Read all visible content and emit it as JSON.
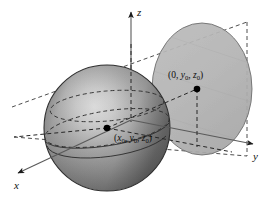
{
  "figure": {
    "type": "3d-geometry-diagram",
    "background_color": "#ffffff"
  },
  "axes": {
    "x": {
      "label": "x",
      "direction": "lower-left",
      "tip": [
        14,
        176
      ],
      "origin": [
        131,
        120
      ]
    },
    "y": {
      "label": "y",
      "direction": "right",
      "tip": [
        257,
        144
      ],
      "origin": [
        131,
        120
      ]
    },
    "z": {
      "label": "z",
      "direction": "up",
      "tip": [
        131,
        8
      ],
      "origin": [
        131,
        120
      ]
    }
  },
  "sphere": {
    "name": "sphere",
    "center_px": [
      107,
      128
    ],
    "radius_px": 63,
    "fill_light": "#d9d9d9",
    "fill_mid": "#8e8e8e",
    "fill_dark": "#4e4e4e",
    "outline_color": "#2b2b2b"
  },
  "plane": {
    "name": "yz-plane-disk",
    "center_px": [
      202,
      89
    ],
    "rx_px": 50,
    "ry_px": 66,
    "fill": "#b6b6b6",
    "outline_color": "#6a6a6a",
    "opacity": 0.92
  },
  "points": [
    {
      "id": "sphere-center",
      "label_prefix": "(",
      "label_parts": [
        "x",
        "0",
        ", y",
        "0",
        ", z",
        "0"
      ],
      "label_text": "(x0, y0, z0)",
      "px": [
        107,
        128
      ],
      "label_px": [
        116,
        140
      ],
      "dot_color": "#000000",
      "dot_radius": 3.3
    },
    {
      "id": "tangency-point",
      "label_prefix": "(",
      "label_parts": [
        "0",
        ", y",
        "0",
        ", z",
        "0"
      ],
      "label_text": "(0, y0, z0)",
      "px": [
        197,
        89
      ],
      "label_px": [
        170,
        78
      ],
      "dot_color": "#000000",
      "dot_radius": 3.3
    }
  ],
  "labels": {
    "x_axis": "x",
    "y_axis": "y",
    "z_axis": "z",
    "center_open": "(",
    "center_x": "x",
    "center_sub0_a": "0",
    "center_comma1": ", ",
    "center_y": "y",
    "center_sub0_b": "0",
    "center_comma2": ", ",
    "center_z": "z",
    "center_sub0_c": "0",
    "center_close": ")",
    "tangent_open": "(",
    "tangent_zero": "0",
    "tangent_comma1": ", ",
    "tangent_y": "y",
    "tangent_sub0_a": "0",
    "tangent_comma2": ", ",
    "tangent_z": "z",
    "tangent_sub0_b": "0",
    "tangent_close": ")"
  },
  "dashed_lines": {
    "color": "#3a3a3a",
    "dash_pattern": "4,3",
    "items": [
      {
        "name": "top-frame-edge",
        "from": [
          12,
          107
        ],
        "to": [
          247,
          22
        ]
      },
      {
        "name": "bottom-frame-edge",
        "from": [
          14,
          137
        ],
        "to": [
          247,
          156
        ]
      },
      {
        "name": "center-to-tangent",
        "from": [
          107,
          128
        ],
        "to": [
          197,
          89
        ]
      },
      {
        "name": "center-horizontal-left",
        "from": [
          107,
          128
        ],
        "to": [
          14,
          137
        ]
      },
      {
        "name": "tangent-vertical-drop",
        "from": [
          197,
          89
        ],
        "to": [
          197,
          146
        ]
      },
      {
        "name": "z-axis-hidden-segment",
        "from": [
          131,
          40
        ],
        "to": [
          131,
          120
        ]
      },
      {
        "name": "equator-ellipse-front",
        "from": [
          44,
          128
        ],
        "to": [
          170,
          128
        ]
      },
      {
        "name": "upper-latitude-ellipse",
        "from": [
          50,
          104
        ],
        "to": [
          164,
          104
        ]
      }
    ]
  }
}
